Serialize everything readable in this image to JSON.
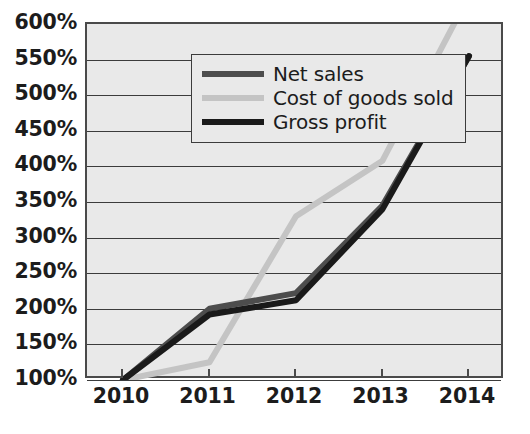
{
  "chart_data": {
    "type": "line",
    "title": "",
    "xlabel": "",
    "ylabel": "",
    "x": [
      "2010",
      "2011",
      "2012",
      "2013",
      "2014"
    ],
    "categories": [
      "2010",
      "2011",
      "2012",
      "2013",
      "2014"
    ],
    "ylim": [
      100,
      600
    ],
    "ytick_labels": [
      "600%",
      "550%",
      "500%",
      "450%",
      "400%",
      "350%",
      "300%",
      "250%",
      "200%",
      "150%",
      "100%"
    ],
    "ytick_values": [
      600,
      550,
      500,
      450,
      400,
      350,
      300,
      250,
      200,
      150,
      100
    ],
    "grid": "horizontal",
    "legend_position": "top-left-inside",
    "series": [
      {
        "name": "Net sales",
        "color": "#4d4d4d",
        "values": [
          100,
          200,
          222,
          345,
          555
        ]
      },
      {
        "name": "Cost of goods sold",
        "color": "#c4c4c4",
        "values": [
          100,
          125,
          330,
          408,
          640
        ]
      },
      {
        "name": "Gross profit",
        "color": "#1a1a1a",
        "values": [
          100,
          192,
          212,
          340,
          555
        ]
      }
    ]
  },
  "legend": {
    "entries": [
      {
        "label": "Net sales",
        "color": "#4d4d4d"
      },
      {
        "label": "Cost of goods sold",
        "color": "#c4c4c4"
      },
      {
        "label": "Gross profit",
        "color": "#1a1a1a"
      }
    ]
  },
  "axes": {
    "y_labels": [
      "600%",
      "550%",
      "500%",
      "450%",
      "400%",
      "350%",
      "300%",
      "250%",
      "200%",
      "150%",
      "100%"
    ],
    "x_labels": [
      "2010",
      "2011",
      "2012",
      "2013",
      "2014"
    ]
  },
  "colors": {
    "plot_background": "#e9e9e9",
    "frame": "#4a4a4a",
    "gridline": "#3c3c3c",
    "text": "#1c1c1c",
    "net_sales": "#4d4d4d",
    "cost_of_goods_sold": "#c4c4c4",
    "gross_profit": "#1a1a1a"
  }
}
